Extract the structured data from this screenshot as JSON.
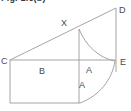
{
  "caption": {
    "text": "Fig. 1.6(b)"
  },
  "figure": {
    "line_color": "#9a9a9a",
    "label_color": "#4a4a4a",
    "background": "#ffffff",
    "vertex_labels": [
      {
        "id": "D",
        "text": "D",
        "x": 119,
        "y": 13
      },
      {
        "id": "X",
        "text": "X",
        "x": 61,
        "y": 26
      },
      {
        "id": "C",
        "text": "C",
        "x": 1,
        "y": 64
      },
      {
        "id": "E",
        "text": "E",
        "x": 120,
        "y": 65
      }
    ],
    "region_labels": [
      {
        "id": "B",
        "text": "B",
        "x": 39,
        "y": 74
      },
      {
        "id": "A-upper",
        "text": "A",
        "x": 86,
        "y": 73
      },
      {
        "id": "A-lower",
        "text": "A",
        "x": 79,
        "y": 88
      }
    ],
    "geometry": {
      "hypotenuse": {
        "from": "C",
        "to": "D",
        "x1": 10,
        "y1": 60,
        "x2": 116,
        "y2": 8
      },
      "right_vertical": {
        "from": "D",
        "to": "below-E",
        "x1": 116,
        "y1": 8,
        "x2": 116,
        "y2": 72
      },
      "baseline": {
        "from": "C",
        "to": "E",
        "x1": 10,
        "y1": 60,
        "x2": 116,
        "y2": 60
      },
      "rect_left": {
        "x1": 10,
        "y1": 60,
        "x2": 10,
        "y2": 103
      },
      "rect_bottom": {
        "x1": 10,
        "y1": 103,
        "x2": 79,
        "y2": 103
      },
      "inner_vertical": {
        "from": "X",
        "x1": 79,
        "y1": 30,
        "x2": 79,
        "y2": 103
      },
      "arc": {
        "description": "arc from X through near E down to rect bottom right corner",
        "start_x": 79,
        "start_y": 30,
        "end_x": 79,
        "end_y": 103,
        "radius": 37
      }
    }
  }
}
